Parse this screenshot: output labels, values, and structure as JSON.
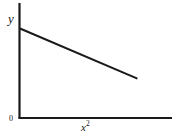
{
  "figure": {
    "background_color": "#ffffff",
    "ink_color": "#1a1a1a",
    "width": 179,
    "height": 137
  },
  "labels": {
    "y_axis": "y",
    "x_axis_base": "x",
    "x_axis_exponent": "2",
    "origin": "0"
  },
  "chart_data": {
    "type": "line",
    "title": "",
    "subtitle": "",
    "xlabel": "x2",
    "ylabel": "y",
    "grid": false,
    "legend": null,
    "annotations": [
      {
        "text": "0",
        "position": "origin",
        "x": 0,
        "y": 0
      }
    ],
    "xlim": [
      0,
      1.09
    ],
    "ylim": [
      0,
      1.24
    ],
    "axis_ticks": {
      "x": [],
      "y": []
    },
    "series": [
      {
        "name": "y vs x squared",
        "style": "solid",
        "color": "#1a1a1a",
        "x": [
          0,
          0.25,
          0.5,
          0.75,
          1.0
        ],
        "y": [
          1.0,
          0.86,
          0.72,
          0.58,
          0.44
        ],
        "intercept": 1.0,
        "slope": -0.56,
        "description": "Straight line with negative slope starting at the y-intercept and descending to the right without reaching the x-axis"
      }
    ]
  }
}
